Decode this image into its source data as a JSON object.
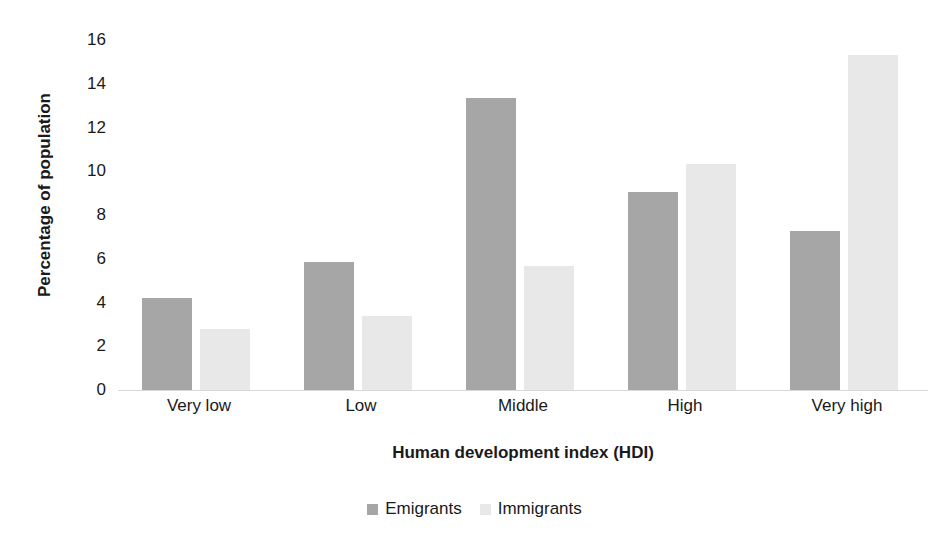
{
  "chart_data": {
    "type": "bar",
    "title": "",
    "xlabel": "Human development index (HDI)",
    "ylabel": "Percentage of population",
    "categories": [
      "Very low",
      "Low",
      "Middle",
      "High",
      "Very high"
    ],
    "series": [
      {
        "name": "Emigrants",
        "color": "#a6a6a6",
        "values": [
          4.2,
          5.85,
          13.35,
          9.05,
          7.25
        ]
      },
      {
        "name": "Immigrants",
        "color": "#e8e8e8",
        "values": [
          2.8,
          3.4,
          5.65,
          10.35,
          15.3
        ]
      }
    ],
    "ylim": [
      0,
      16
    ],
    "yticks": [
      0,
      2,
      4,
      6,
      8,
      10,
      12,
      14,
      16
    ],
    "ytick_labels": [
      "0",
      "2",
      "4",
      "6",
      "8",
      "10",
      "12",
      "14",
      "16"
    ],
    "grid": false,
    "legend_position": "bottom",
    "background": "#ffffff"
  },
  "axes": {
    "y_title": "Percentage of population",
    "x_title": "Human development index (HDI)"
  },
  "legend": {
    "items": [
      {
        "label": "Emigrants",
        "swatch": "legend-swatch-emigrants"
      },
      {
        "label": "Immigrants",
        "swatch": "legend-swatch-immigrants"
      }
    ]
  }
}
